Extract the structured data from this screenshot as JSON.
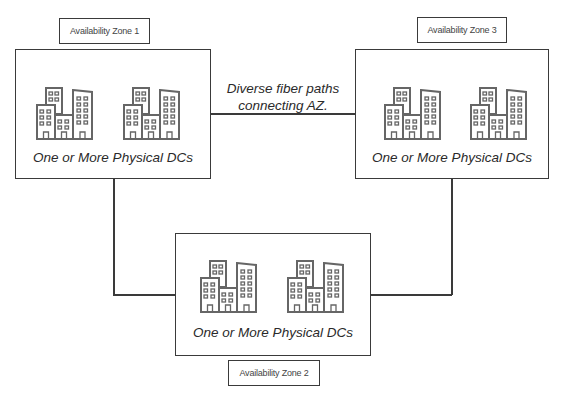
{
  "diagram": {
    "zones": [
      {
        "id": "az1",
        "label": "Availability Zone 1",
        "caption": "One or More Physical DCs",
        "icons": [
          "building-cluster-icon",
          "building-cluster-icon"
        ]
      },
      {
        "id": "az2",
        "label": "Availability Zone 2",
        "caption": "One or More Physical DCs",
        "icons": [
          "building-cluster-icon",
          "building-cluster-icon"
        ]
      },
      {
        "id": "az3",
        "label": "Availability Zone 3",
        "caption": "One or More Physical DCs",
        "icons": [
          "building-cluster-icon",
          "building-cluster-icon"
        ]
      }
    ],
    "fiber_note": {
      "line1": "Diverse fiber paths",
      "line2": "connecting AZ."
    },
    "connections": [
      [
        "az1",
        "az3"
      ],
      [
        "az1",
        "az2"
      ],
      [
        "az3",
        "az2"
      ]
    ],
    "colors": {
      "stroke": "#3a3a3a",
      "icon_stroke": "#666666",
      "background": "#ffffff"
    }
  }
}
